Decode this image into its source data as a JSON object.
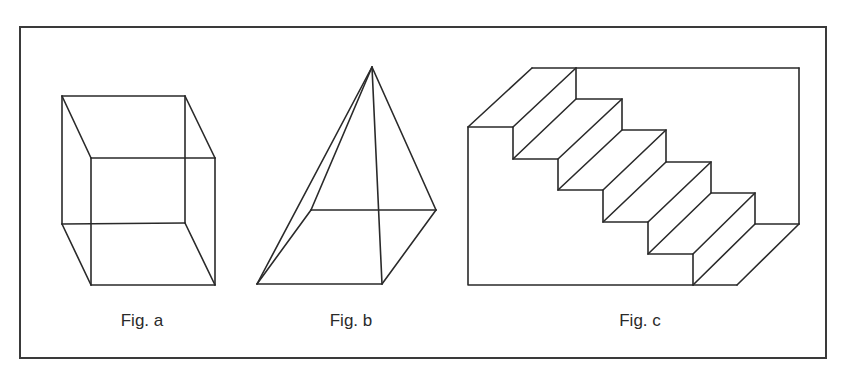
{
  "frame": {
    "x": 20,
    "y": 27,
    "width": 806,
    "height": 331,
    "stroke": "#3a3a3a"
  },
  "figures": [
    {
      "id": "fig-a",
      "caption": "Fig. a",
      "shape": "wireframe cube",
      "caption_pos": {
        "x": 142,
        "y": 311
      },
      "edges": [
        [
          [
            62,
            96
          ],
          [
            185,
            96
          ]
        ],
        [
          [
            185,
            96
          ],
          [
            185,
            223
          ]
        ],
        [
          [
            185,
            223
          ],
          [
            62,
            224
          ]
        ],
        [
          [
            62,
            224
          ],
          [
            62,
            96
          ]
        ],
        [
          [
            91,
            158
          ],
          [
            215,
            158
          ]
        ],
        [
          [
            215,
            158
          ],
          [
            215,
            285
          ]
        ],
        [
          [
            215,
            285
          ],
          [
            91,
            285
          ]
        ],
        [
          [
            91,
            285
          ],
          [
            91,
            158
          ]
        ],
        [
          [
            62,
            96
          ],
          [
            91,
            158
          ]
        ],
        [
          [
            185,
            96
          ],
          [
            215,
            158
          ]
        ],
        [
          [
            62,
            224
          ],
          [
            91,
            285
          ]
        ],
        [
          [
            185,
            223
          ],
          [
            215,
            285
          ]
        ]
      ]
    },
    {
      "id": "fig-b",
      "caption": "Fig. b",
      "shape": "wireframe square pyramid",
      "caption_pos": {
        "x": 351,
        "y": 311
      },
      "edges": [
        [
          [
            311,
            210
          ],
          [
            436,
            210
          ]
        ],
        [
          [
            436,
            210
          ],
          [
            382,
            284
          ]
        ],
        [
          [
            382,
            284
          ],
          [
            257,
            284
          ]
        ],
        [
          [
            257,
            284
          ],
          [
            311,
            210
          ]
        ],
        [
          [
            372,
            67
          ],
          [
            311,
            210
          ]
        ],
        [
          [
            372,
            67
          ],
          [
            257,
            284
          ]
        ],
        [
          [
            372,
            67
          ],
          [
            382,
            284
          ]
        ],
        [
          [
            372,
            67
          ],
          [
            436,
            210
          ]
        ]
      ]
    },
    {
      "id": "fig-c",
      "caption": "Fig. c",
      "shape": "staircase in box",
      "caption_pos": {
        "x": 640,
        "y": 311
      },
      "front_profile": [
        [
          468,
          285
        ],
        [
          468,
          127
        ],
        [
          513,
          127
        ],
        [
          513,
          159
        ],
        [
          558,
          159
        ],
        [
          558,
          190
        ],
        [
          603,
          190
        ],
        [
          603,
          222
        ],
        [
          648,
          222
        ],
        [
          648,
          254
        ],
        [
          693,
          254
        ],
        [
          693,
          285
        ],
        [
          468,
          285
        ]
      ],
      "back_profile": [
        [
          532,
          68
        ],
        [
          576,
          68
        ],
        [
          576,
          99
        ],
        [
          622,
          99
        ],
        [
          622,
          130
        ],
        [
          666,
          130
        ],
        [
          666,
          162
        ],
        [
          711,
          162
        ],
        [
          711,
          193
        ],
        [
          755,
          193
        ],
        [
          755,
          224
        ],
        [
          799,
          224
        ]
      ],
      "box_edges": [
        [
          [
            576,
            68
          ],
          [
            799,
            68
          ]
        ],
        [
          [
            799,
            68
          ],
          [
            799,
            224
          ]
        ],
        [
          [
            693,
            285
          ],
          [
            737,
            285
          ]
        ],
        [
          [
            737,
            285
          ],
          [
            799,
            224
          ]
        ]
      ],
      "connectors": [
        [
          [
            468,
            127
          ],
          [
            532,
            68
          ]
        ],
        [
          [
            513,
            127
          ],
          [
            576,
            68
          ]
        ],
        [
          [
            513,
            159
          ],
          [
            576,
            99
          ]
        ],
        [
          [
            558,
            159
          ],
          [
            622,
            99
          ]
        ],
        [
          [
            558,
            190
          ],
          [
            622,
            130
          ]
        ],
        [
          [
            603,
            190
          ],
          [
            666,
            130
          ]
        ],
        [
          [
            603,
            222
          ],
          [
            666,
            162
          ]
        ],
        [
          [
            648,
            222
          ],
          [
            711,
            162
          ]
        ],
        [
          [
            648,
            254
          ],
          [
            711,
            193
          ]
        ],
        [
          [
            693,
            254
          ],
          [
            755,
            193
          ]
        ],
        [
          [
            693,
            285
          ],
          [
            755,
            224
          ]
        ]
      ]
    }
  ],
  "colors": {
    "line": "#2a2a2a",
    "background": "#ffffff"
  }
}
